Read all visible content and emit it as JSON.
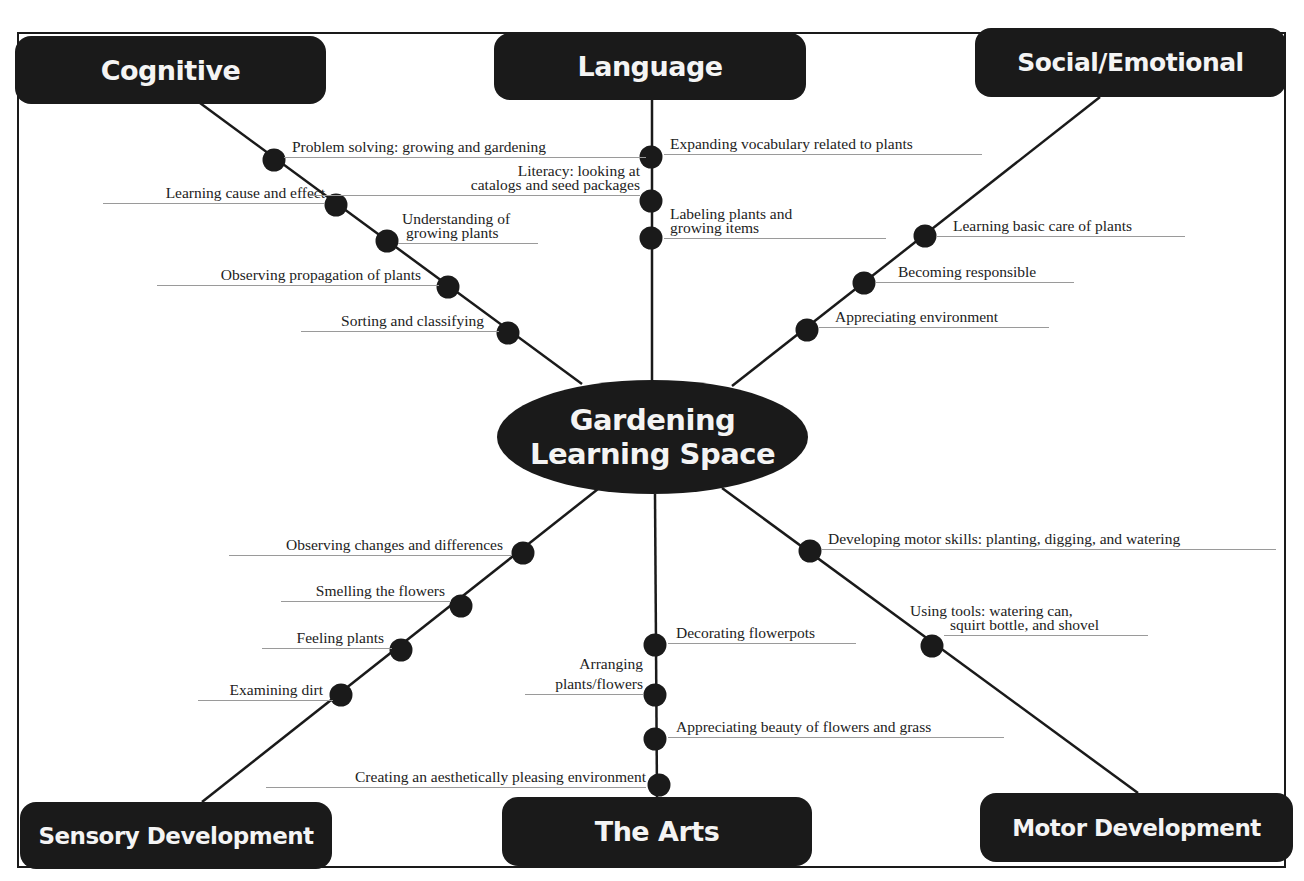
{
  "diagram": {
    "type": "mind-map",
    "center": {
      "line1": "Gardening",
      "line2": "Learning Space"
    },
    "categories": {
      "cognitive": {
        "label": "Cognitive",
        "items": [
          "Problem solving: growing and gardening",
          "Learning cause and effect",
          [
            "Understanding of",
            "growing plants"
          ],
          "Observing propagation of plants",
          "Sorting and classifying"
        ]
      },
      "language": {
        "label": "Language",
        "items": [
          "Expanding vocabulary related to plants",
          [
            "Literacy: looking at",
            "catalogs and seed packages"
          ],
          [
            "Labeling plants and",
            "growing items"
          ]
        ]
      },
      "social_emotional": {
        "label": "Social/Emotional",
        "items": [
          "Learning basic care of plants",
          "Becoming responsible",
          "Appreciating environment"
        ]
      },
      "sensory": {
        "label": "Sensory Development",
        "items": [
          "Observing changes and differences",
          "Smelling the flowers",
          "Feeling plants",
          "Examining dirt"
        ]
      },
      "arts": {
        "label": "The Arts",
        "items": [
          "Decorating flowerpots",
          [
            "Arranging",
            "plants/flowers"
          ],
          "Appreciating beauty of flowers and grass",
          "Creating an aesthetically pleasing environment"
        ]
      },
      "motor": {
        "label": "Motor Development",
        "items": [
          "Developing motor skills: planting, digging, and watering",
          [
            "Using tools: watering can,",
            "squirt bottle, and shovel"
          ]
        ]
      }
    }
  },
  "colors": {
    "box_fill": "#1a1a1a",
    "box_text": "#f4f4f4",
    "line": "#1a1a1a",
    "label_text": "#222222",
    "underline": "#9a9a9a"
  }
}
